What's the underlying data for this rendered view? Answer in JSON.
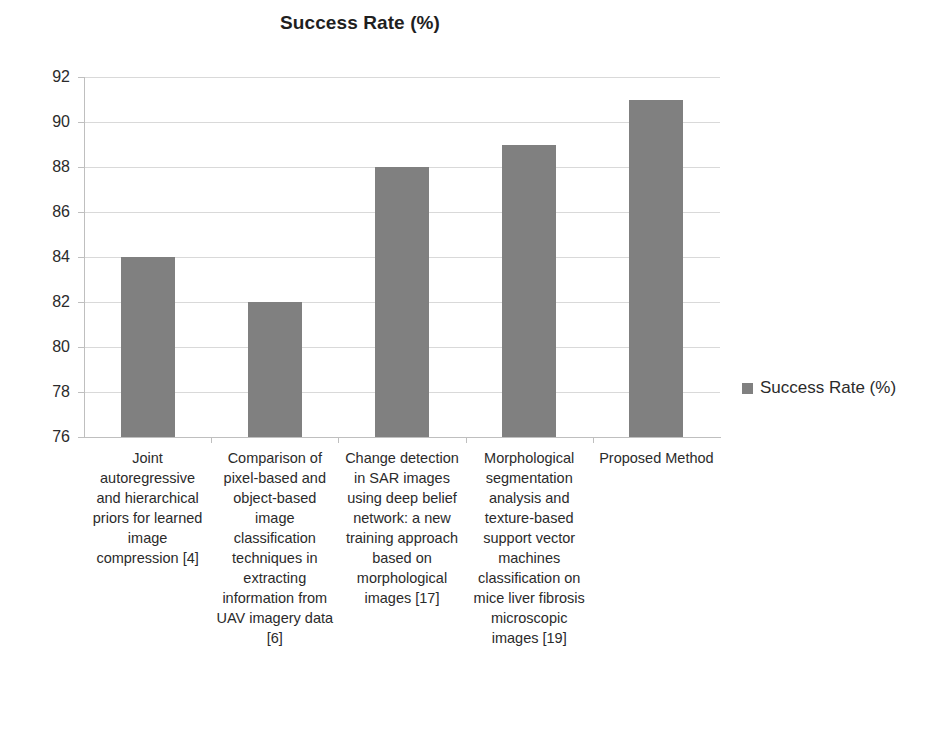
{
  "chart_data": {
    "type": "bar",
    "title": "Success Rate (%)",
    "xlabel": "",
    "ylabel": "",
    "ylim": [
      76,
      92
    ],
    "ytick_step": 2,
    "yticks": [
      92,
      90,
      88,
      86,
      84,
      82,
      80,
      78,
      76
    ],
    "grid": true,
    "legend_position": "right",
    "series": [
      {
        "name": "Success Rate (%)",
        "color": "#808080",
        "values": [
          84,
          82,
          88,
          89,
          91
        ]
      }
    ],
    "categories": [
      "Joint autoregressive and hierarchical priors for learned image compression [4]",
      "Comparison of pixel-based and object-based image classification techniques in extracting information from UAV imagery data [6]",
      "Change detection in SAR images using deep belief network: a new training approach based on morphological images [17]",
      "Morphological segmentation analysis and texture-based support vector machines classification on mice liver fibrosis microscopic images [19]",
      "Proposed Method"
    ]
  },
  "legend": {
    "entries": [
      {
        "label": "Success Rate (%)",
        "color": "#808080"
      }
    ]
  },
  "colors": {
    "bar": "#808080",
    "grid": "#d9d9d9",
    "axis": "#bfbfbf",
    "text": "#2b2b2b",
    "background": "#ffffff"
  }
}
